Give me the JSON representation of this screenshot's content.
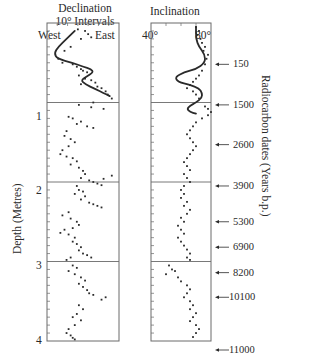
{
  "figure": {
    "declination_title_1": "Declination",
    "declination_title_2": "10° Intervals",
    "declination_left_label": "West",
    "declination_right_label": "East",
    "inclination_title": "Inclination",
    "inclination_left_label": "40°",
    "inclination_right_label": "80°",
    "depth_axis_label": "Depth (Metres)",
    "radiocarbon_axis_label": "Radiocarbon dates (Years b.p.)",
    "depth_ticks": [
      "1",
      "2",
      "3",
      "4"
    ]
  },
  "radiocarbon_dates": [
    {
      "label": "150",
      "depth": 0.52
    },
    {
      "label": "1500",
      "depth": 1.03
    },
    {
      "label": "2600",
      "depth": 1.53
    },
    {
      "label": "3900",
      "depth": 2.05
    },
    {
      "label": "5300",
      "depth": 2.5
    },
    {
      "label": "6900",
      "depth": 2.82
    },
    {
      "label": "8200",
      "depth": 3.14
    },
    {
      "label": "10100",
      "depth": 3.45
    },
    {
      "label": "11000",
      "depth": 4.23
    }
  ],
  "colors": {
    "ink": "#2a2a2a",
    "axis": "#6a6a6a",
    "background": "#ffffff"
  },
  "chart_data": [
    {
      "type": "scatter",
      "title": "Declination (10° Intervals)",
      "xlabel": "Declination (West → East)",
      "ylabel": "Depth (Metres)",
      "x_tick_labels": [
        "West",
        "East"
      ],
      "xlim_note": "10° intervals; ~7 divisions West to East",
      "xlim": [
        -35,
        35
      ],
      "ylim": [
        4,
        0
      ],
      "grid": "horizontal lines at 1, 2, 3 m",
      "smooth_curve": {
        "name": "Declination model curve (0-1 m)",
        "points": [
          [
            -8,
            0.1
          ],
          [
            -16,
            0.2
          ],
          [
            -24,
            0.3
          ],
          [
            -28,
            0.38
          ],
          [
            -25,
            0.45
          ],
          [
            -10,
            0.5
          ],
          [
            0,
            0.55
          ],
          [
            8,
            0.58
          ],
          [
            10,
            0.62
          ],
          [
            4,
            0.67
          ],
          [
            -2,
            0.72
          ],
          [
            2,
            0.77
          ],
          [
            12,
            0.83
          ],
          [
            20,
            0.88
          ],
          [
            26,
            0.92
          ]
        ]
      },
      "series": [
        {
          "name": "Declination measurements",
          "points": [
            [
              -5,
              0.08
            ],
            [
              2,
              0.1
            ],
            [
              5,
              0.14
            ],
            [
              8,
              0.18
            ],
            [
              -2,
              0.2
            ],
            [
              -12,
              0.3
            ],
            [
              -18,
              0.35
            ],
            [
              -24,
              0.45
            ],
            [
              -20,
              0.5
            ],
            [
              -10,
              0.52
            ],
            [
              -6,
              0.55
            ],
            [
              -2,
              0.58
            ],
            [
              0,
              0.6
            ],
            [
              4,
              0.62
            ],
            [
              -4,
              0.66
            ],
            [
              2,
              0.7
            ],
            [
              8,
              0.72
            ],
            [
              12,
              0.75
            ],
            [
              -2,
              0.77
            ],
            [
              14,
              0.8
            ],
            [
              18,
              0.82
            ],
            [
              22,
              0.86
            ],
            [
              24,
              0.9
            ],
            [
              28,
              0.95
            ],
            [
              10,
              1.0
            ],
            [
              -4,
              1.03
            ],
            [
              8,
              1.06
            ],
            [
              20,
              1.08
            ],
            [
              -14,
              1.18
            ],
            [
              -10,
              1.2
            ],
            [
              -2,
              1.24
            ],
            [
              -6,
              1.27
            ],
            [
              4,
              1.3
            ],
            [
              10,
              1.32
            ],
            [
              -16,
              1.36
            ],
            [
              -18,
              1.42
            ],
            [
              -12,
              1.46
            ],
            [
              -8,
              1.5
            ],
            [
              -14,
              1.55
            ],
            [
              -20,
              1.6
            ],
            [
              -22,
              1.65
            ],
            [
              -16,
              1.68
            ],
            [
              -10,
              1.7
            ],
            [
              -6,
              1.74
            ],
            [
              -12,
              1.78
            ],
            [
              -4,
              1.82
            ],
            [
              0,
              1.86
            ],
            [
              2,
              1.9
            ],
            [
              -2,
              1.95
            ],
            [
              6,
              1.98
            ],
            [
              10,
              2.0
            ],
            [
              14,
              2.02
            ],
            [
              18,
              2.04
            ],
            [
              20,
              1.96
            ],
            [
              28,
              1.92
            ],
            [
              -6,
              2.05
            ],
            [
              -4,
              2.1
            ],
            [
              0,
              2.12
            ],
            [
              -8,
              2.15
            ],
            [
              2,
              2.18
            ],
            [
              -2,
              2.22
            ],
            [
              6,
              2.26
            ],
            [
              10,
              2.28
            ],
            [
              14,
              2.3
            ],
            [
              18,
              2.32
            ],
            [
              -14,
              2.38
            ],
            [
              -20,
              2.42
            ],
            [
              -12,
              2.46
            ],
            [
              -6,
              2.5
            ],
            [
              -4,
              2.54
            ],
            [
              -10,
              2.58
            ],
            [
              -18,
              2.6
            ],
            [
              -22,
              2.64
            ],
            [
              -14,
              2.66
            ],
            [
              -8,
              2.7
            ],
            [
              -10,
              2.75
            ],
            [
              -6,
              2.78
            ],
            [
              -2,
              2.82
            ],
            [
              -4,
              2.86
            ],
            [
              0,
              2.9
            ],
            [
              4,
              2.92
            ],
            [
              8,
              2.95
            ],
            [
              -12,
              2.95
            ],
            [
              -16,
              2.98
            ],
            [
              -10,
              3.05
            ],
            [
              -6,
              3.08
            ],
            [
              -14,
              3.12
            ],
            [
              -8,
              3.16
            ],
            [
              -2,
              3.2
            ],
            [
              2,
              3.24
            ],
            [
              -4,
              3.28
            ],
            [
              0,
              3.32
            ],
            [
              4,
              3.36
            ],
            [
              6,
              3.4
            ],
            [
              10,
              3.42
            ],
            [
              22,
              3.45
            ],
            [
              18,
              3.48
            ],
            [
              -4,
              3.55
            ],
            [
              0,
              3.6
            ],
            [
              -6,
              3.66
            ],
            [
              -10,
              3.7
            ],
            [
              -2,
              3.74
            ],
            [
              -8,
              3.8
            ],
            [
              -14,
              3.85
            ],
            [
              -16,
              3.9
            ],
            [
              -12,
              3.93
            ],
            [
              -10,
              3.96
            ],
            [
              -8,
              3.98
            ]
          ]
        }
      ]
    },
    {
      "type": "scatter",
      "title": "Inclination",
      "xlabel": "Inclination (degrees)",
      "ylabel": "Depth (Metres)",
      "x_tick_labels": [
        "40°",
        "80°"
      ],
      "xlim": [
        40,
        80
      ],
      "ylim": [
        4,
        0
      ],
      "grid": "horizontal lines at 1, 2, 3 m",
      "smooth_curve": {
        "name": "Inclination model curve (0-1.1 m)",
        "points": [
          [
            70,
            0.05
          ],
          [
            70,
            0.2
          ],
          [
            72,
            0.3
          ],
          [
            76,
            0.4
          ],
          [
            76,
            0.5
          ],
          [
            70,
            0.58
          ],
          [
            62,
            0.62
          ],
          [
            56,
            0.68
          ],
          [
            58,
            0.74
          ],
          [
            66,
            0.78
          ],
          [
            72,
            0.82
          ],
          [
            74,
            0.88
          ],
          [
            74,
            0.94
          ],
          [
            70,
            1.0
          ],
          [
            66,
            1.04
          ],
          [
            64,
            1.08
          ],
          [
            66,
            1.12
          ],
          [
            70,
            1.14
          ]
        ]
      },
      "series": [
        {
          "name": "Inclination measurements",
          "points": [
            [
              70,
              0.05
            ],
            [
              72,
              0.1
            ],
            [
              71,
              0.15
            ],
            [
              73,
              0.2
            ],
            [
              74,
              0.25
            ],
            [
              76,
              0.3
            ],
            [
              75,
              0.35
            ],
            [
              78,
              0.4
            ],
            [
              77,
              0.45
            ],
            [
              76,
              0.52
            ],
            [
              74,
              0.6
            ],
            [
              72,
              0.66
            ],
            [
              70,
              0.7
            ],
            [
              68,
              0.74
            ],
            [
              66,
              0.78
            ],
            [
              64,
              0.82
            ],
            [
              68,
              0.86
            ],
            [
              70,
              0.9
            ],
            [
              72,
              0.95
            ],
            [
              76,
              1.05
            ],
            [
              78,
              1.08
            ],
            [
              80,
              1.12
            ],
            [
              78,
              1.16
            ],
            [
              74,
              1.2
            ],
            [
              70,
              1.25
            ],
            [
              68,
              1.3
            ],
            [
              66,
              1.35
            ],
            [
              64,
              1.4
            ],
            [
              66,
              1.45
            ],
            [
              68,
              1.5
            ],
            [
              70,
              1.55
            ],
            [
              68,
              1.6
            ],
            [
              66,
              1.65
            ],
            [
              64,
              1.7
            ],
            [
              62,
              1.75
            ],
            [
              64,
              1.8
            ],
            [
              66,
              1.85
            ],
            [
              62,
              1.9
            ],
            [
              64,
              1.95
            ],
            [
              66,
              2.0
            ],
            [
              62,
              2.05
            ],
            [
              60,
              2.1
            ],
            [
              62,
              2.15
            ],
            [
              60,
              2.2
            ],
            [
              64,
              2.25
            ],
            [
              62,
              2.3
            ],
            [
              66,
              2.35
            ],
            [
              64,
              2.4
            ],
            [
              60,
              2.45
            ],
            [
              62,
              2.5
            ],
            [
              58,
              2.55
            ],
            [
              60,
              2.6
            ],
            [
              62,
              2.65
            ],
            [
              58,
              2.7
            ],
            [
              60,
              2.75
            ],
            [
              62,
              2.8
            ],
            [
              64,
              2.85
            ],
            [
              66,
              2.9
            ],
            [
              64,
              2.95
            ],
            [
              66,
              2.98
            ],
            [
              52,
              3.05
            ],
            [
              54,
              3.1
            ],
            [
              56,
              3.12
            ],
            [
              50,
              3.16
            ],
            [
              58,
              3.2
            ],
            [
              60,
              3.25
            ],
            [
              64,
              3.3
            ],
            [
              66,
              3.35
            ],
            [
              64,
              3.4
            ],
            [
              62,
              3.45
            ],
            [
              66,
              3.5
            ],
            [
              68,
              3.55
            ],
            [
              66,
              3.6
            ],
            [
              70,
              3.65
            ],
            [
              68,
              3.7
            ],
            [
              66,
              3.75
            ],
            [
              70,
              3.8
            ],
            [
              72,
              3.85
            ],
            [
              70,
              3.9
            ],
            [
              68,
              3.95
            ]
          ]
        }
      ]
    }
  ]
}
